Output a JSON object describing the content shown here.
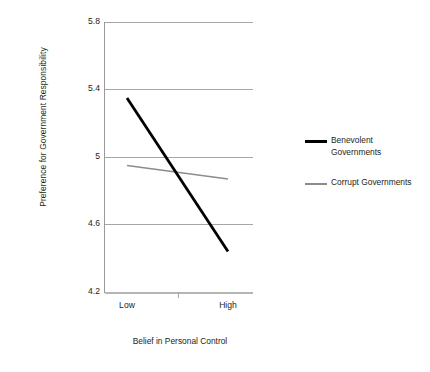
{
  "chart_data": {
    "type": "line",
    "title": "",
    "xlabel": "Belief in Personal Control",
    "ylabel": "Preference for Government Responsibility",
    "categories": [
      "Low",
      "High"
    ],
    "x_tick_labels": [
      "Low",
      "High"
    ],
    "y_tick_labels": [
      "5.8",
      "5.4",
      "5",
      "4.6",
      "4.2"
    ],
    "y_ticks": [
      5.8,
      5.4,
      5.0,
      4.6,
      4.2
    ],
    "ylim": [
      4.2,
      5.8
    ],
    "grid": true,
    "legend_position": "right",
    "series": [
      {
        "name": "Benevolent Governments",
        "values": [
          5.35,
          4.44
        ],
        "color": "#000000",
        "line_width": 2.8
      },
      {
        "name": "Corrupt Governments",
        "values": [
          4.95,
          4.87
        ],
        "color": "#8c8c8c",
        "line_width": 1.5
      }
    ]
  },
  "axes": {
    "y_title": "Preference for Government Responsibility",
    "x_title": "Belief in Personal Control",
    "y_tick_0": "5.8",
    "y_tick_1": "5.4",
    "y_tick_2": "5",
    "y_tick_3": "4.6",
    "y_tick_4": "4.2",
    "x_tick_0": "Low",
    "x_tick_1": "High"
  },
  "legend": {
    "items": [
      {
        "label": "Benevolent Governments",
        "line_1": "Benevolent",
        "line_2": "Governments",
        "color": "#000000"
      },
      {
        "label": "Corrupt Governments",
        "line_1": "Corrupt Governments",
        "line_2": "",
        "color": "#8c8c8c"
      }
    ]
  },
  "colors": {
    "benevolent": "#000000",
    "corrupt": "#8c8c8c",
    "gridline": "#a6a6a6",
    "text": "#231f20",
    "background": "#ffffff"
  }
}
